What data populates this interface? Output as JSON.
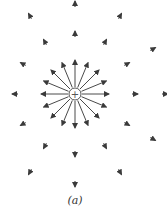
{
  "figure": {
    "caption": "(a)",
    "charge_symbol": "+",
    "charge_sign": "positive",
    "field_direction": "outward",
    "inner_arrow_count": 16,
    "rings": [
      {
        "name": "middle-ring",
        "arrow_count": 12
      },
      {
        "name": "outer-ring",
        "arrow_count": 12
      }
    ],
    "colors": {
      "arrow": "#4a4a4a",
      "charge": "#555555"
    }
  }
}
